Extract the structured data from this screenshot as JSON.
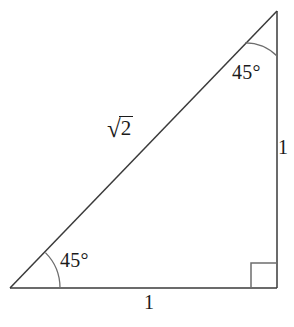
{
  "figure": {
    "stroke_color": "#3a3a3a",
    "text_color": "#1b1b1b",
    "background_color": "#ffffff",
    "labels": {
      "angle_top_right": "45°",
      "angle_bottom_left": "45°",
      "leg_right": "1",
      "leg_bottom": "1",
      "hypotenuse_radical_sign": "√",
      "hypotenuse_radicand": "2",
      "hypotenuse_full": "√2"
    },
    "markers": {
      "right_angle_name": "right-angle-square",
      "arc_top_name": "angle-arc-top-right",
      "arc_bottom_name": "angle-arc-bottom-left"
    },
    "geometry": {
      "apex_x": 277,
      "apex_y": 11,
      "bottom_left_x": 10,
      "bottom_left_y": 288,
      "bottom_right_x": 277,
      "bottom_right_y": 288
    }
  }
}
